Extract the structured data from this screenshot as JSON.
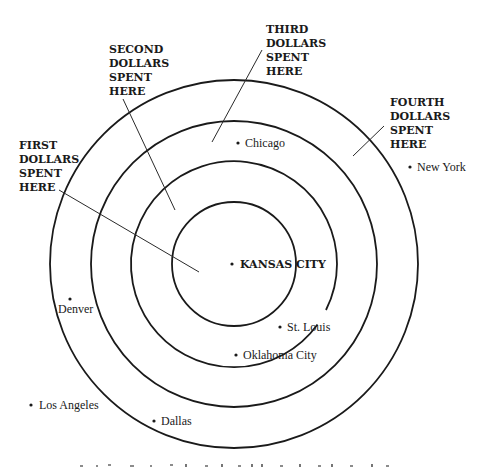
{
  "diagram": {
    "type": "concentric-rings",
    "center": {
      "x": 234,
      "y": 264
    },
    "rings": [
      {
        "name": "inner",
        "r": 62
      },
      {
        "name": "second",
        "r": 103
      },
      {
        "name": "third",
        "r": 143
      },
      {
        "name": "outer",
        "r": 184
      }
    ],
    "zone_labels": [
      {
        "id": "first",
        "lines": [
          "FIRST",
          "DOLLARS",
          "SPENT",
          "HERE"
        ]
      },
      {
        "id": "second",
        "lines": [
          "SECOND",
          "DOLLARS",
          "SPENT",
          "HERE"
        ]
      },
      {
        "id": "third",
        "lines": [
          "THIRD",
          "DOLLARS",
          "SPENT",
          "HERE"
        ]
      },
      {
        "id": "fourth",
        "lines": [
          "FOURTH",
          "DOLLARS",
          "SPENT",
          "HERE"
        ]
      }
    ],
    "cities": [
      {
        "name": "KANSAS CITY",
        "hub": true
      },
      {
        "name": "Chicago"
      },
      {
        "name": "New York"
      },
      {
        "name": "St. Louis"
      },
      {
        "name": "Oklahoma City"
      },
      {
        "name": "Denver"
      },
      {
        "name": "Los Angeles"
      },
      {
        "name": "Dallas"
      }
    ],
    "colors": {
      "ink": "#1a1a1a",
      "background": "#ffffff"
    }
  }
}
